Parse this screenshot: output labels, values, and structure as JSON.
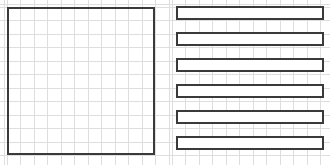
{
  "figure": {
    "title": "Two-panel line drawing: grid square and horizontal bars",
    "width": 330,
    "height": 165,
    "background_color": "#ffffff"
  },
  "style": {
    "grid_line_color": "#dedede",
    "grid_line_width": 1,
    "outline_color": "#3a3a3a",
    "outline_width": 2,
    "fill_color": "#ffffff"
  },
  "grid": {
    "columns": 11,
    "rows": 11,
    "cell_width": 13.5,
    "cell_height": 13.5,
    "visible": true
  },
  "panels": [
    {
      "id": "left",
      "name": "grid-square-panel",
      "label": "Square outline over grid",
      "x": 0,
      "y": 0,
      "width": 165,
      "height": 165,
      "shapes": [
        {
          "type": "rect",
          "name": "square-outline",
          "x": 7,
          "y": 7,
          "width": 148,
          "height": 148,
          "stroke": "#3a3a3a",
          "stroke_width": 2,
          "fill": "none"
        }
      ]
    },
    {
      "id": "right",
      "name": "horizontal-bars-panel",
      "label": "Six horizontal bars over grid",
      "x": 165,
      "y": 0,
      "width": 165,
      "height": 165,
      "bar_count": 6,
      "shapes": [
        {
          "type": "rect",
          "name": "bar-1",
          "x": 11,
          "y": 6,
          "width": 148,
          "height": 14,
          "stroke": "#3a3a3a",
          "stroke_width": 2,
          "fill": "#ffffff"
        },
        {
          "type": "rect",
          "name": "bar-2",
          "x": 11,
          "y": 32,
          "width": 148,
          "height": 14,
          "stroke": "#3a3a3a",
          "stroke_width": 2,
          "fill": "#ffffff"
        },
        {
          "type": "rect",
          "name": "bar-3",
          "x": 11,
          "y": 58,
          "width": 148,
          "height": 14,
          "stroke": "#3a3a3a",
          "stroke_width": 2,
          "fill": "#ffffff"
        },
        {
          "type": "rect",
          "name": "bar-4",
          "x": 11,
          "y": 84,
          "width": 148,
          "height": 14,
          "stroke": "#3a3a3a",
          "stroke_width": 2,
          "fill": "#ffffff"
        },
        {
          "type": "rect",
          "name": "bar-5",
          "x": 11,
          "y": 110,
          "width": 148,
          "height": 14,
          "stroke": "#3a3a3a",
          "stroke_width": 2,
          "fill": "#ffffff"
        },
        {
          "type": "rect",
          "name": "bar-6",
          "x": 11,
          "y": 136,
          "width": 148,
          "height": 14,
          "stroke": "#3a3a3a",
          "stroke_width": 2,
          "fill": "#ffffff"
        }
      ]
    }
  ]
}
